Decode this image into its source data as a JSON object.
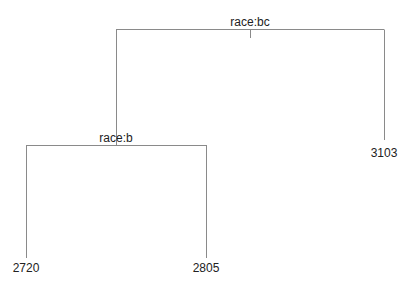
{
  "tree": {
    "root": {
      "split": "race:bc"
    },
    "left": {
      "split": "race:b"
    },
    "leaves": [
      {
        "value": "2720"
      },
      {
        "value": "2805"
      },
      {
        "value": "3103"
      }
    ]
  }
}
